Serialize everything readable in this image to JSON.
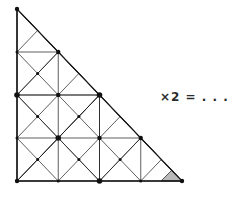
{
  "figure": {
    "shape": "right-isosceles-triangle",
    "vertices": {
      "top": [
        17,
        9
      ],
      "bottom_left": [
        17,
        181
      ],
      "bottom_right": [
        182,
        181
      ]
    },
    "subdivision_depth": 5,
    "stroke_color": "#1a1a1a",
    "stroke_width": 0.7,
    "outline_stroke_width": 1.1,
    "node_color": "#111111",
    "node_radius": 1.9,
    "background_color": "#ffffff",
    "shaded_triangle": {
      "label": "unit-triangle",
      "points": [
        [
          161,
          181
        ],
        [
          182,
          181
        ],
        [
          171.5,
          170.5
        ]
      ],
      "fill_color": "#b9b9b9",
      "stroke_color": "#1a1a1a"
    }
  },
  "equation": {
    "text": "×2 = . . . .",
    "multiplier_symbol": "×",
    "multiplier_value": "2",
    "equals_symbol": "=",
    "answer_placeholder": ". . . .",
    "color": "#2b2b2b"
  }
}
